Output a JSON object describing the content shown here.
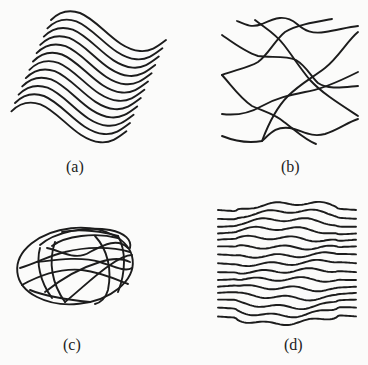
{
  "figure": {
    "line_color": "#1c1c1c",
    "background_color": "#fbfbfa",
    "panels": [
      {
        "id": "a",
        "caption": "(a)",
        "description": "Parallel sinusoidal (S-shaped) curves, sheared diagonally",
        "curve_count": 12,
        "base_path": "M51,20 C58,13 68,9 80,13 C100,21 116,49 140,51 C151,52 158,46 166,40",
        "step_dx": -3.6,
        "step_dy": 8.3
      },
      {
        "id": "b",
        "caption": "(b)",
        "description": "Randomly oriented intersecting wavy curves",
        "paths": [
          "M237,21 C246,25 252,28 262,24 C275,18 285,14 297,24 C305,31 312,34 325,32 C338,30 348,27 358,26",
          "M255,20 C265,28 275,33 284,45 C294,58 300,68 310,80 C322,93 338,103 358,116",
          "M222,75 C235,70 248,68 258,62 C268,55 275,40 285,32 C296,25 315,22 332,19",
          "M222,35 C232,42 245,52 258,56 C270,58 285,55 296,60 C306,66 310,75 318,83 C328,90 345,87 358,86",
          "M222,75 C232,86 240,98 252,106 C265,112 275,114 284,122 C295,130 305,140 316,144",
          "M222,114 C238,116 250,113 262,106 C276,98 290,95 305,92 C320,90 338,82 358,72",
          "M222,136 C232,140 246,144 262,141 C270,134 275,126 290,128 C302,130 310,138 325,134 C338,130 348,122 358,119",
          "M262,141 C268,125 276,108 288,96 C300,84 312,78 325,68 C338,58 348,40 358,32"
        ]
      },
      {
        "id": "c",
        "caption": "(c)",
        "description": "Ellipsoid-like closed shape with intersecting internal ellipses and meridian arcs",
        "outer": {
          "cx": 75,
          "cy": 266,
          "rx": 58,
          "ry": 38,
          "rotate": -6
        },
        "paths": [
          "M40,245 C55,232 85,226 110,230 C125,233 132,240 130,248",
          "M52,246 C65,236 95,232 118,238",
          "M47,248 C60,250 75,262 90,252 C105,244 118,238 128,248",
          "M38,262 C55,260 80,256 100,262 C115,267 125,272 132,268",
          "M20,268 C35,264 50,255 65,252 C85,247 110,246 130,252",
          "M22,285 C40,275 60,268 82,270 C100,272 118,280 128,284",
          "M40,248 C36,262 40,282 52,298",
          "M55,242 C48,262 52,284 65,302",
          "M45,292 C60,280 80,268 100,262 C112,258 122,258 130,262",
          "M65,302 C80,290 95,275 110,265 C120,258 128,255 132,255",
          "M95,236 C108,250 112,270 108,290 C106,298 100,303 95,304",
          "M118,236 C126,250 126,272 118,292",
          "M30,290 C45,296 70,300 90,302",
          "M62,232 C80,228 105,232 118,236"
        ]
      },
      {
        "id": "d",
        "caption": "(d)",
        "description": "Horizontal parallel wavy lines distorted by a central lens-shaped region",
        "line_count": 15,
        "x_start": 218,
        "x_end": 356,
        "y_start": 210,
        "spacing": 7.6
      }
    ]
  }
}
